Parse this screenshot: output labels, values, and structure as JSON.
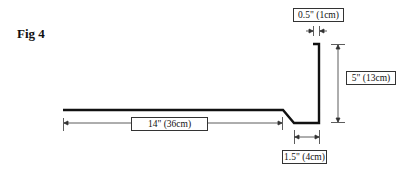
{
  "figure": {
    "label": "Fig 4"
  },
  "dimensions": {
    "lip_width": "0.5\" (1cm)",
    "wall_height": "5\" (13cm)",
    "base_length": "14\" (36cm)",
    "channel_width": "1.5\" (4cm)"
  },
  "colors": {
    "profile": "#111111",
    "dimension_line": "#333333",
    "background": "#ffffff"
  }
}
